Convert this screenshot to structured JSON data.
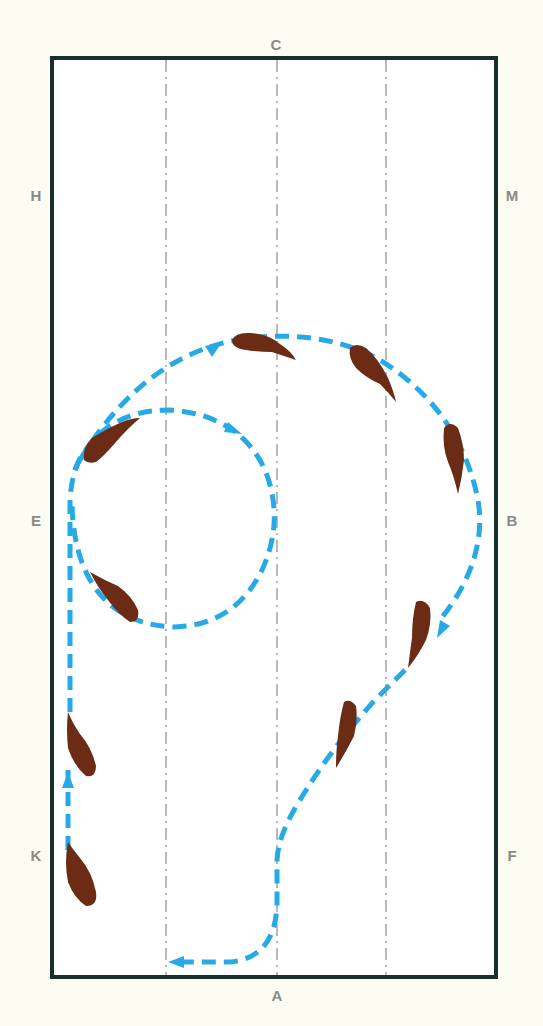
{
  "diagram": {
    "type": "dressage-arena-figure",
    "arena_markers": {
      "C": "C",
      "H": "H",
      "M": "M",
      "E": "E",
      "B": "B",
      "K": "K",
      "F": "F",
      "A": "A"
    },
    "colors": {
      "background": "#fcfcf3",
      "arena_fill": "#ffffff",
      "arena_border": "#17302a",
      "centerlines": "#8a8a8a",
      "path": "#27a9e8",
      "horse": "#6b2b14",
      "marker_text": "#8a8a86"
    },
    "path_description": "Start at K tracking up the left long side, circle left near E (small volte), continue into a large half-circle toward B, then diagonal line toward A and turn left along short side",
    "horse_count": 9
  }
}
